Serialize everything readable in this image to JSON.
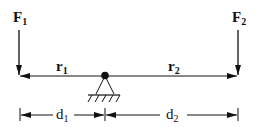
{
  "diagram": {
    "type": "lever-free-body-diagram",
    "forces": [
      {
        "label": "F",
        "subscript": "1",
        "x": 19,
        "direction": "down"
      },
      {
        "label": "F",
        "subscript": "2",
        "x": 238,
        "direction": "down"
      }
    ],
    "lever_arms": [
      {
        "label": "r",
        "subscript": "1",
        "direction": "left"
      },
      {
        "label": "r",
        "subscript": "2",
        "direction": "right"
      }
    ],
    "distances": [
      {
        "label": "d",
        "subscript": "1"
      },
      {
        "label": "d",
        "subscript": "2"
      }
    ],
    "pivot": {
      "symbol": "fixed-pin-support",
      "x": 105
    },
    "colors": {
      "ink": "#111111",
      "background": "#ffffff"
    }
  }
}
